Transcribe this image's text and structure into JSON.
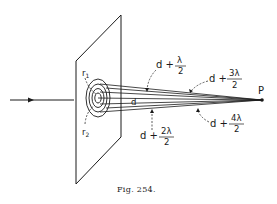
{
  "figure": {
    "caption": "Fig. 254.",
    "point_label": "P",
    "radius_labels": {
      "r1": "r",
      "r1_sub": "1",
      "r2": "r",
      "r2_sub": "2"
    },
    "center_distance_label": "d",
    "path_labels": [
      {
        "prefix": "d +",
        "numerator": "λ",
        "denominator": "2"
      },
      {
        "prefix": "d +",
        "numerator": "2λ",
        "denominator": "2"
      },
      {
        "prefix": "d +",
        "numerator": "3λ",
        "denominator": "2"
      },
      {
        "prefix": "d +",
        "numerator": "4λ",
        "denominator": "2"
      }
    ],
    "colors": {
      "ink": "#1a1a1a",
      "background": "#ffffff"
    }
  }
}
